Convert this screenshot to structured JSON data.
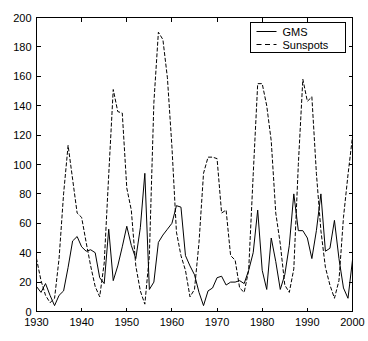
{
  "chart_data": {
    "type": "line",
    "title": "",
    "xlabel": "",
    "ylabel": "",
    "xlim": [
      1930,
      2000
    ],
    "ylim": [
      0,
      200
    ],
    "grid": false,
    "legend_position": "top-right",
    "xticks": [
      1930,
      1940,
      1950,
      1960,
      1970,
      1980,
      1990,
      2000
    ],
    "xticklabels": [
      "1930",
      "1940",
      "1950",
      "1960",
      "1970",
      "1980",
      "1990",
      "2000"
    ],
    "yticks": [
      0,
      20,
      40,
      60,
      80,
      100,
      120,
      140,
      160,
      180,
      200
    ],
    "yticklabels": [
      "0",
      "20",
      "40",
      "60",
      "80",
      "100",
      "120",
      "140",
      "160",
      "180",
      "200"
    ],
    "x": [
      1930,
      1931,
      1932,
      1933,
      1934,
      1935,
      1936,
      1937,
      1938,
      1939,
      1940,
      1941,
      1942,
      1943,
      1944,
      1945,
      1946,
      1947,
      1948,
      1949,
      1950,
      1951,
      1952,
      1953,
      1954,
      1955,
      1956,
      1957,
      1958,
      1959,
      1960,
      1961,
      1962,
      1963,
      1964,
      1965,
      1966,
      1967,
      1968,
      1969,
      1970,
      1971,
      1972,
      1973,
      1974,
      1975,
      1976,
      1977,
      1978,
      1979,
      1980,
      1981,
      1982,
      1983,
      1984,
      1985,
      1986,
      1987,
      1988,
      1989,
      1990,
      1991,
      1992,
      1993,
      1994,
      1995,
      1996,
      1997,
      1998,
      1999,
      2000
    ],
    "series": [
      {
        "name": "GMS",
        "style": "solid",
        "color": "#000000",
        "values": [
          17,
          13,
          19,
          11,
          4,
          11,
          14,
          30,
          48,
          51,
          44,
          41,
          42,
          40,
          23,
          19,
          56,
          21,
          31,
          44,
          58,
          45,
          36,
          57,
          94,
          15,
          20,
          47,
          52,
          56,
          60,
          72,
          71,
          38,
          31,
          25,
          13,
          4,
          14,
          16,
          23,
          24,
          18,
          20,
          20,
          21,
          19,
          28,
          40,
          69,
          28,
          15,
          50,
          34,
          15,
          25,
          45,
          80,
          55,
          55,
          50,
          36,
          55,
          80,
          41,
          43,
          62,
          36,
          16,
          9,
          35
        ],
        "note": "Geomagnetic storm index (solid line)"
      },
      {
        "name": "Sunspots",
        "style": "dashed",
        "color": "#000000",
        "values": [
          36,
          21,
          11,
          6,
          9,
          36,
          80,
          113,
          90,
          67,
          64,
          47,
          31,
          17,
          10,
          33,
          93,
          151,
          136,
          135,
          84,
          69,
          31,
          14,
          5,
          38,
          142,
          190,
          185,
          159,
          112,
          54,
          38,
          28,
          10,
          15,
          47,
          94,
          105,
          105,
          104,
          67,
          69,
          38,
          35,
          16,
          13,
          28,
          93,
          155,
          155,
          140,
          116,
          67,
          46,
          18,
          13,
          29,
          100,
          158,
          143,
          146,
          94,
          55,
          30,
          18,
          9,
          21,
          64,
          93,
          119
        ],
        "note": "Sunspot number (dashed line)"
      }
    ]
  },
  "legend": {
    "entries": [
      {
        "label": "GMS",
        "style": "solid"
      },
      {
        "label": "Sunspots",
        "style": "dashed"
      }
    ]
  },
  "axes": {
    "box": true,
    "tick_direction": "in",
    "background": "#ffffff",
    "foreground": "#000000"
  }
}
